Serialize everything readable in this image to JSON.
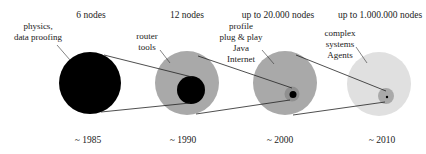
{
  "colors": {
    "black": "#000000",
    "medium_gray": "#a9a9a9",
    "dark_gray_inner": "#8f8f8f",
    "light_gray": "#e0e0e0",
    "line": "#222222",
    "text": "#222222"
  },
  "stages": [
    {
      "header": "6 nodes",
      "year": "~ 1985",
      "annotation": [
        "physics,",
        "data proofing"
      ]
    },
    {
      "header": "12 nodes",
      "year": "~ 1990",
      "annotation": [
        "router",
        "tools"
      ]
    },
    {
      "header": "up to 20.000 nodes",
      "year": "~ 2000",
      "annotation": [
        "profile",
        "plug & play",
        "Java",
        "Internet"
      ]
    },
    {
      "header": "up to 1.000.000 nodes",
      "year": "~ 2010",
      "annotation": [
        "complex",
        "systems",
        "Agents"
      ]
    }
  ]
}
